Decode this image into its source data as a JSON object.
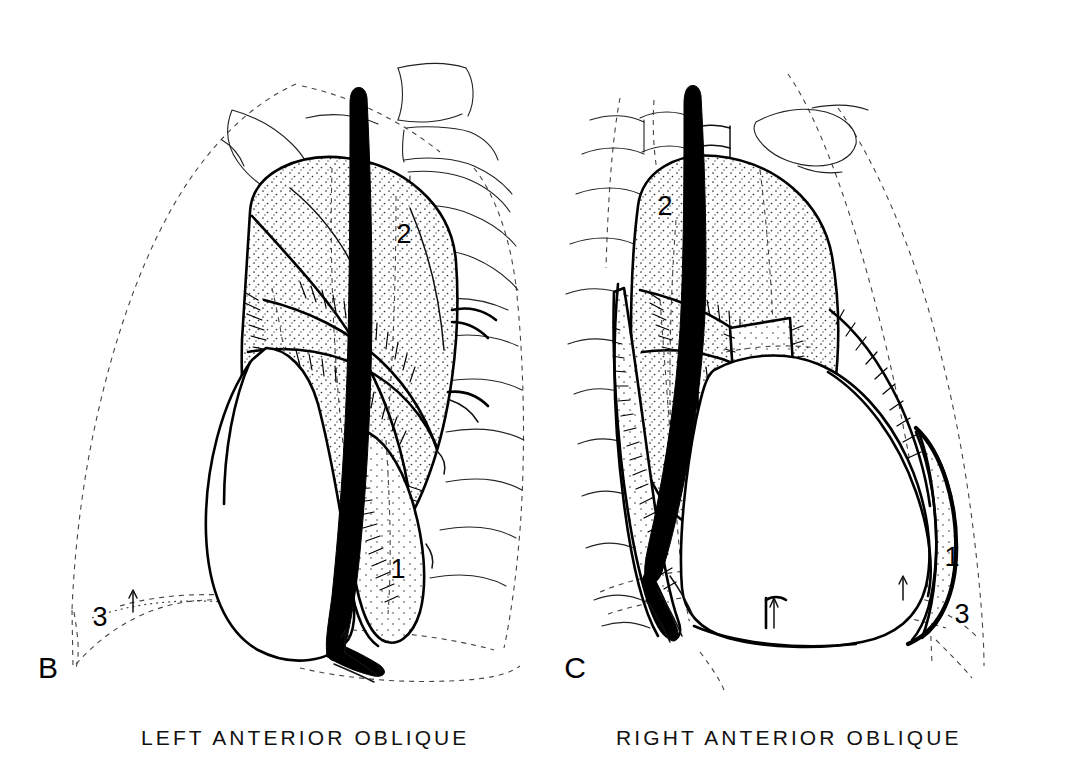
{
  "figure": {
    "background_color": "#ffffff",
    "ink_color": "#000000",
    "kind": "anatomical-line-drawing",
    "panel_count": 2
  },
  "panels": [
    {
      "id": "panel-b",
      "letter": "B",
      "caption": "LEFT ANTERIOR OBLIQUE",
      "letter_position": {
        "x": 48,
        "y": 678
      },
      "caption_position": {
        "x": 141,
        "y": 745
      },
      "annotations": [
        {
          "label": "1",
          "x": 398,
          "y": 578,
          "structure": "retrocardiac / lower lung region"
        },
        {
          "label": "2",
          "x": 404,
          "y": 243,
          "structure": "upper mediastinal stippled region"
        },
        {
          "label": "3",
          "x": 100,
          "y": 626,
          "structure": "posterior costophrenic region"
        }
      ],
      "arrows": [
        {
          "x": 133,
          "y": 598,
          "direction": "up"
        },
        {
          "x": 345,
          "y": 637,
          "direction": "up"
        }
      ]
    },
    {
      "id": "panel-c",
      "letter": "C",
      "caption": "RIGHT ANTERIOR OBLIQUE",
      "letter_position": {
        "x": 575,
        "y": 678
      },
      "caption_position": {
        "x": 616,
        "y": 745
      },
      "annotations": [
        {
          "label": "1",
          "x": 952,
          "y": 566,
          "structure": "anterior cardiophrenic region"
        },
        {
          "label": "2",
          "x": 665,
          "y": 215,
          "structure": "upper mediastinal stippled region"
        },
        {
          "label": "3",
          "x": 962,
          "y": 623,
          "structure": "posterior costophrenic region"
        }
      ],
      "arrows": [
        {
          "x": 903,
          "y": 585,
          "direction": "up"
        },
        {
          "x": 774,
          "y": 612,
          "direction": "up"
        }
      ]
    }
  ],
  "captions": {
    "left": "LEFT ANTERIOR OBLIQUE",
    "right": "RIGHT ANTERIOR OBLIQUE"
  },
  "panel_letters": {
    "left": "B",
    "right": "C"
  },
  "legend_numbers": {
    "one": "1",
    "two": "2",
    "three": "3"
  },
  "structures": {
    "chest_wall": "dashed thoracic outline",
    "diaphragm": "dashed domed line",
    "trachea": "banded tubular airway",
    "vertebrae": "stacked vertebral bodies",
    "ribs": "thin curved rib lines",
    "clavicle": "outlined clavicle",
    "great_vessel": "solid black vessel silhouette",
    "heart": "white cardiac silhouette",
    "hilum": "stippled and hatched hilar mass"
  }
}
